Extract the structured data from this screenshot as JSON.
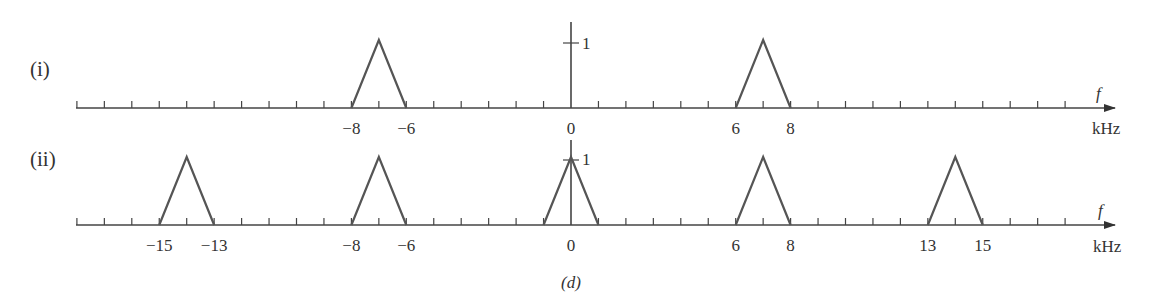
{
  "figure": {
    "caption": "(d)",
    "axis_unit": "kHz",
    "axis_var": "f",
    "amplitude_label": "1"
  },
  "chart_data": [
    {
      "type": "line",
      "title": "(i)",
      "xlabel": "f (kHz)",
      "ylabel": "",
      "xlim": [
        -18,
        19
      ],
      "ylim": [
        0,
        1
      ],
      "tick_spacing": 1,
      "tick_labels": [
        "-8",
        "-6",
        "0",
        "6",
        "8"
      ],
      "triangles": [
        {
          "left": -8,
          "peak": -7,
          "right": -6,
          "height": 1
        },
        {
          "left": 6,
          "peak": 7,
          "right": 8,
          "height": 1
        }
      ],
      "annotations": [
        "1",
        "f",
        "kHz"
      ]
    },
    {
      "type": "line",
      "title": "(ii)",
      "xlabel": "f (kHz)",
      "ylabel": "",
      "xlim": [
        -18,
        19
      ],
      "ylim": [
        0,
        1
      ],
      "tick_spacing": 1,
      "tick_labels": [
        "-15",
        "-13",
        "-8",
        "-6",
        "0",
        "6",
        "8",
        "13",
        "15"
      ],
      "triangles": [
        {
          "left": -15,
          "peak": -14,
          "right": -13,
          "height": 1
        },
        {
          "left": -8,
          "peak": -7,
          "right": -6,
          "height": 1
        },
        {
          "left": -1,
          "peak": 0,
          "right": 1,
          "height": 1
        },
        {
          "left": 6,
          "peak": 7,
          "right": 8,
          "height": 1
        },
        {
          "left": 13,
          "peak": 14,
          "right": 15,
          "height": 1
        }
      ],
      "annotations": [
        "1",
        "f",
        "kHz"
      ]
    }
  ],
  "rows": [
    {
      "label": "(i)",
      "tick_labels": [
        {
          "k": -8,
          "text": "−8"
        },
        {
          "k": -6,
          "text": "−6"
        },
        {
          "k": 0,
          "text": "0"
        },
        {
          "k": 6,
          "text": "6"
        },
        {
          "k": 8,
          "text": "8"
        }
      ]
    },
    {
      "label": "(ii)",
      "tick_labels": [
        {
          "k": -15,
          "text": "−15"
        },
        {
          "k": -13,
          "text": "−13"
        },
        {
          "k": -8,
          "text": "−8"
        },
        {
          "k": -6,
          "text": "−6"
        },
        {
          "k": 0,
          "text": "0"
        },
        {
          "k": 6,
          "text": "6"
        },
        {
          "k": 8,
          "text": "8"
        },
        {
          "k": 13,
          "text": "13"
        },
        {
          "k": 15,
          "text": "15"
        }
      ]
    }
  ]
}
